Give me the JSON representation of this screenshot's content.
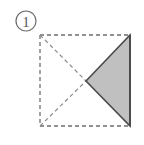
{
  "figure": {
    "step_label": {
      "name": "step-number",
      "text": "1",
      "shape": "circle",
      "center_x": 26,
      "center_y": 21,
      "radius": 10,
      "stroke_color": "#6b6b6b",
      "text_color": "#5a5a5a"
    },
    "canvas": {
      "width": 144,
      "height": 145,
      "background_color": "#ffffff"
    },
    "square": {
      "name": "paper-square",
      "left": 40,
      "top": 35,
      "right": 130,
      "bottom": 126,
      "edges": [
        {
          "name": "top-edge",
          "style": "dashed",
          "color": "#6e6e6e",
          "x1": 40,
          "y1": 35,
          "x2": 130,
          "y2": 35
        },
        {
          "name": "left-edge",
          "style": "dashed",
          "color": "#6e6e6e",
          "x1": 40,
          "y1": 35,
          "x2": 40,
          "y2": 126
        },
        {
          "name": "bottom-edge",
          "style": "dashed",
          "color": "#6e6e6e",
          "x1": 40,
          "y1": 126,
          "x2": 130,
          "y2": 126
        },
        {
          "name": "right-edge",
          "style": "solid",
          "color": "#4a4a4a",
          "x1": 130,
          "y1": 35,
          "x2": 130,
          "y2": 126
        }
      ]
    },
    "creases": [
      {
        "name": "crease-top-left-to-center",
        "style": "dashed",
        "color": "#8a8a8a",
        "x1": 40,
        "y1": 35,
        "x2": 86,
        "y2": 81
      },
      {
        "name": "crease-bottom-left-to-center",
        "style": "dashed",
        "color": "#8a8a8a",
        "x1": 40,
        "y1": 126,
        "x2": 86,
        "y2": 81
      }
    ],
    "shaded_triangle": {
      "name": "folded-flap",
      "fill_color": "#c0c0c0",
      "stroke_color": "#4a4a4a",
      "points": "86,81 130,35 130,126",
      "vertices": [
        {
          "name": "apex-center",
          "x": 86,
          "y": 81
        },
        {
          "name": "top-right-corner",
          "x": 130,
          "y": 35
        },
        {
          "name": "bottom-right-corner",
          "x": 130,
          "y": 126
        }
      ]
    },
    "dash_pattern": "4,3",
    "stroke_width": 1.3
  }
}
